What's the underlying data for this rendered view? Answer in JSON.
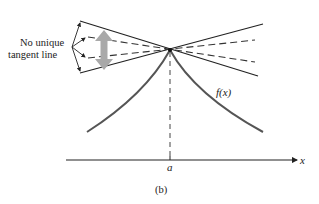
{
  "figure": {
    "caption": "(b)",
    "annotation": {
      "line1": "No unique",
      "line2": "tangent line"
    },
    "function_label": "f(x)",
    "point_label": "a",
    "axis_label": "x"
  },
  "colors": {
    "line": "#222222",
    "curve": "#444444",
    "highlight_arrow": "#a9a9a9",
    "background": "#ffffff"
  }
}
